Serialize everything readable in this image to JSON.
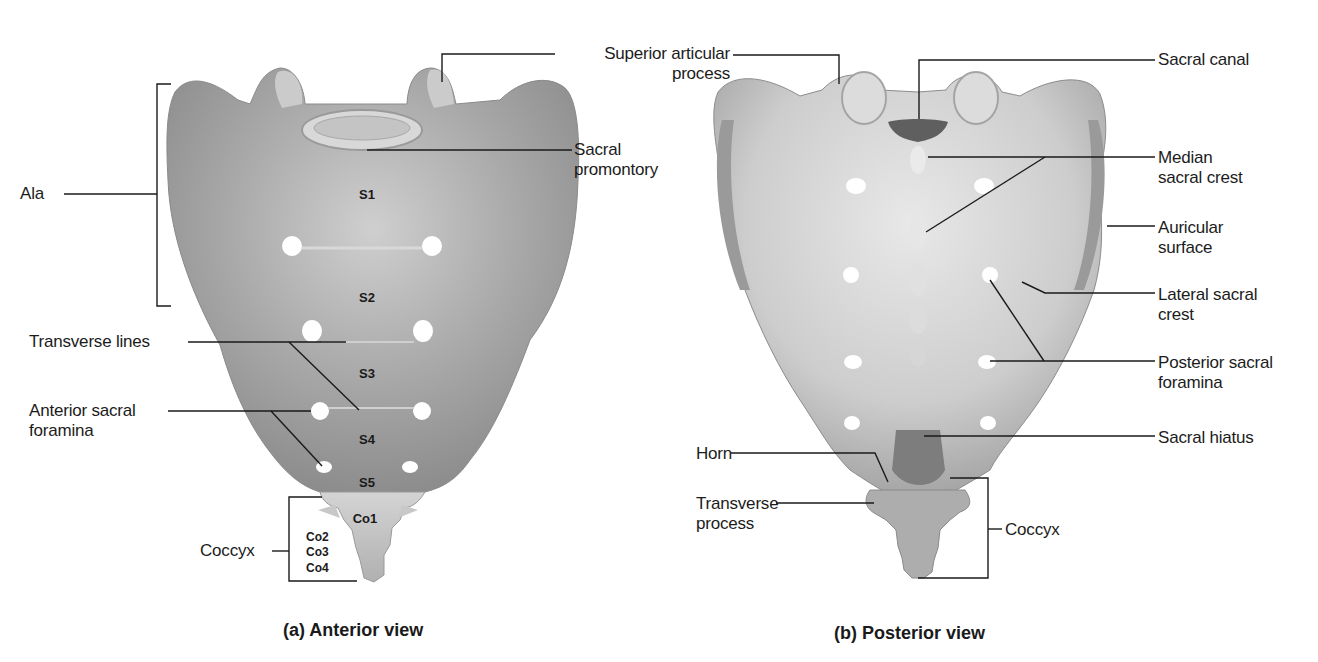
{
  "figure": {
    "panels": [
      {
        "id": "a",
        "caption": "(a) Anterior view",
        "labels": {
          "ala": "Ala",
          "transverse_lines": "Transverse lines",
          "anterior_sacral_foramina": "Anterior sacral\nforamina",
          "coccyx": "Coccyx",
          "sacral_promontory": "Sacral\npromontory"
        },
        "segments": {
          "s1": "S1",
          "s2": "S2",
          "s3": "S3",
          "s4": "S4",
          "s5": "S5",
          "co1": "Co1",
          "co2": "Co2",
          "co3": "Co3",
          "co4": "Co4"
        }
      },
      {
        "id": "b",
        "caption": "(b) Posterior view",
        "labels": {
          "superior_articular_process": "Superior articular\nprocess",
          "sacral_canal": "Sacral canal",
          "median_sacral_crest": "Median\nsacral crest",
          "auricular_surface": "Auricular\nsurface",
          "lateral_sacral_crest": "Lateral sacral\ncrest",
          "posterior_sacral_foramina": "Posterior sacral\nforamina",
          "sacral_hiatus": "Sacral hiatus",
          "horn": "Horn",
          "transverse_process": "Transverse\nprocess",
          "coccyx": "Coccyx"
        }
      }
    ],
    "colors": {
      "background": "#ffffff",
      "bone_light": "#e6e6e6",
      "bone_mid": "#b8b8b8",
      "bone_dark": "#7a7a7a",
      "leader_line": "#1a1a1a"
    }
  }
}
